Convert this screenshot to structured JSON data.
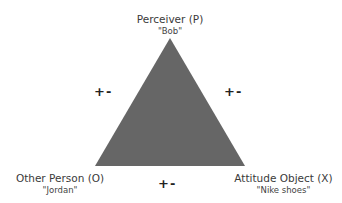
{
  "diagram": {
    "triangle_color": "#666666",
    "nodes": {
      "perceiver": {
        "label": "Perceiver (P)",
        "example": "\"Bob\""
      },
      "other": {
        "label": "Other Person (O)",
        "example": "\"Jordan\""
      },
      "object": {
        "label": "Attitude Object (X)",
        "example": "\"Nike shoes\""
      }
    },
    "edges": {
      "p_o": {
        "sign": "+-"
      },
      "p_x": {
        "sign": "+-"
      },
      "o_x": {
        "sign": "+-"
      }
    }
  }
}
